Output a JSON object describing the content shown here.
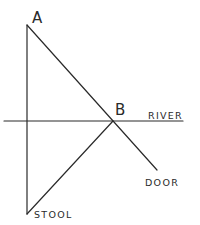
{
  "diagram": {
    "type": "geometry-sketch",
    "points": {
      "A": {
        "label": "A"
      },
      "B": {
        "label": "B"
      },
      "stool": {
        "label": "STOOL"
      },
      "door": {
        "label": "DOOR"
      }
    },
    "river": {
      "label": "RIVER"
    },
    "segments": [
      {
        "from": "A",
        "to": "stool",
        "name": "line-a-stool"
      },
      {
        "from": "A",
        "to": "door",
        "name": "line-a-door",
        "passes_through": "B"
      },
      {
        "from": "stool",
        "to": "B",
        "name": "line-stool-b"
      }
    ],
    "stroke_color": "#2a2a2a",
    "background_color": "#ffffff"
  }
}
